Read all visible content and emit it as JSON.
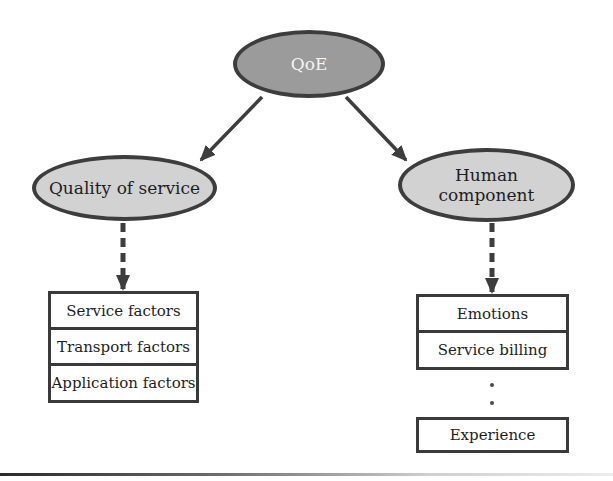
{
  "diagram": {
    "root": {
      "label": "QoE"
    },
    "branches": [
      {
        "label": "Quality of service",
        "factors": [
          "Service factors",
          "Transport factors",
          "Application factors"
        ]
      },
      {
        "label_line1": "Human",
        "label_line2": "component",
        "factors": [
          "Emotions",
          "Service billing"
        ],
        "ellipsis": "⋮",
        "last_factor": "Experience"
      }
    ]
  },
  "colors": {
    "root_fill": "#9b9b9b",
    "node_fill": "#d2d2d2",
    "outline": "#3d3d3d",
    "arrow": "#3d3d3d"
  }
}
